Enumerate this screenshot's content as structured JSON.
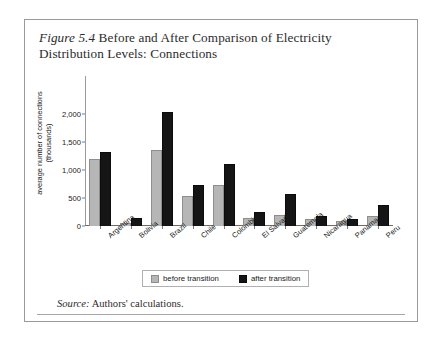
{
  "figure": {
    "number": "Figure 5.4",
    "caption": "Before and After Comparison of Electricity Distribution Levels: Connections",
    "source_word": "Source:",
    "source_text": "Authors' calculations."
  },
  "legend": {
    "position": "bottom-center",
    "entries": [
      {
        "label": "before transition",
        "color": "#b6b6b6"
      },
      {
        "label": "after transition",
        "color": "#151515"
      }
    ]
  },
  "chart_data": {
    "type": "bar",
    "title": "Figure 5.4 Before and After Comparison of Electricity Distribution Levels: Connections",
    "xlabel": "",
    "ylabel": "average number of connections (thousands)",
    "ylabel_lines": [
      "average number of connections",
      "(thousands)"
    ],
    "ylim": [
      0,
      2000
    ],
    "yticks": [
      0,
      500,
      1000,
      1500,
      2000
    ],
    "ytick_labels": [
      "0",
      "500",
      "1,000",
      "1,500",
      "2,000"
    ],
    "grid": false,
    "categories": [
      "Argentina",
      "Bolivia",
      "Brazil",
      "Chile",
      "Colombia",
      "El Salvador",
      "Guatemala",
      "Nicaragua",
      "Panama",
      "Peru"
    ],
    "series": [
      {
        "name": "before transition",
        "color": "#b6b6b6",
        "values": [
          1200,
          60,
          1350,
          530,
          740,
          150,
          200,
          130,
          90,
          170
        ]
      },
      {
        "name": "after transition",
        "color": "#151515",
        "values": [
          1320,
          140,
          2030,
          740,
          1100,
          250,
          580,
          170,
          130,
          370
        ]
      }
    ]
  }
}
